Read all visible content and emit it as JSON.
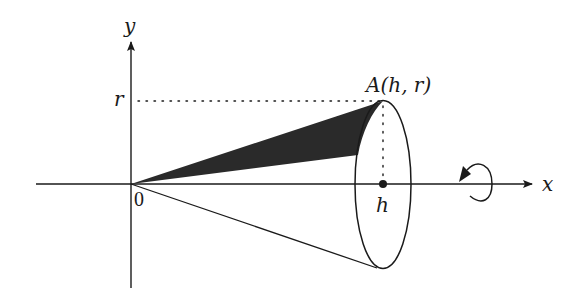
{
  "diagram": {
    "type": "cone of revolution about x-axis",
    "labels": {
      "y_axis": "y",
      "x_axis": "x",
      "r_tick": "r",
      "origin": "0",
      "h_tick": "h",
      "point_A": "A(h, r)"
    },
    "elements": [
      "y-axis with arrow",
      "x-axis with arrow",
      "dotted line from r on y-axis to point A",
      "dotted vertical line from A down to h",
      "shaded triangular region from origin to A",
      "cone side line from origin to bottom of ellipse",
      "elliptical base at x = h",
      "point h on x-axis",
      "rotation arrow around x-axis"
    ],
    "colors": {
      "ink": "#1a1a1a",
      "shade": "#2a2a2a",
      "background": "#ffffff"
    }
  }
}
